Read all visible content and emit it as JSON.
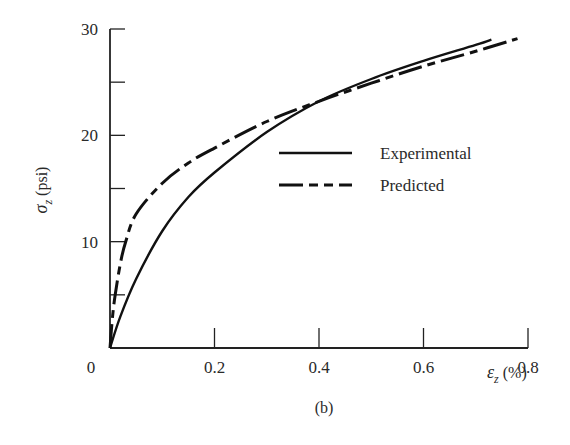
{
  "chart_data": {
    "type": "line",
    "title": "",
    "caption": "(b)",
    "xlabel": "ε_z (%)",
    "xlabel_symbol": "ε",
    "xlabel_sub": "z",
    "xlabel_unit": "(%)",
    "ylabel": "σ_z (psi)",
    "ylabel_symbol": "σ",
    "ylabel_sub": "z",
    "ylabel_unit": "(psi)",
    "xlim": [
      0,
      0.8
    ],
    "ylim": [
      0,
      30
    ],
    "x_ticks": [
      0,
      0.2,
      0.4,
      0.6,
      0.8
    ],
    "x_tick_labels": [
      "0",
      "0.2",
      "0.4",
      "0.6",
      "0.8"
    ],
    "y_ticks": [
      0,
      5,
      10,
      15,
      20,
      25,
      30
    ],
    "y_tick_labels": [
      "",
      "",
      "10",
      "",
      "20",
      "",
      "30"
    ],
    "origin_label": "0",
    "grid": false,
    "legend_position": "center-right",
    "series": [
      {
        "name": "Experimental",
        "style": "solid",
        "x": [
          0,
          0.02,
          0.05,
          0.1,
          0.15,
          0.2,
          0.3,
          0.4,
          0.5,
          0.6,
          0.7,
          0.73
        ],
        "values": [
          0,
          3.0,
          6.5,
          11.0,
          14.2,
          16.5,
          20.3,
          23.2,
          25.3,
          27.0,
          28.5,
          29.0
        ]
      },
      {
        "name": "Predicted",
        "style": "dash-dot",
        "x": [
          0,
          0.005,
          0.01,
          0.02,
          0.03,
          0.05,
          0.1,
          0.15,
          0.2,
          0.3,
          0.4,
          0.5,
          0.6,
          0.7,
          0.78
        ],
        "values": [
          0,
          3.0,
          5.0,
          8.0,
          10.0,
          12.6,
          15.5,
          17.4,
          18.8,
          21.3,
          23.2,
          24.9,
          26.5,
          27.9,
          29.1
        ]
      }
    ]
  },
  "legend": {
    "items": [
      {
        "label": "Experimental",
        "style": "solid"
      },
      {
        "label": "Predicted",
        "style": "dash-dot"
      }
    ]
  },
  "colors": {
    "line": "#111111",
    "axis": "#222222",
    "text": "#2a2a2a",
    "background": "#ffffff"
  }
}
